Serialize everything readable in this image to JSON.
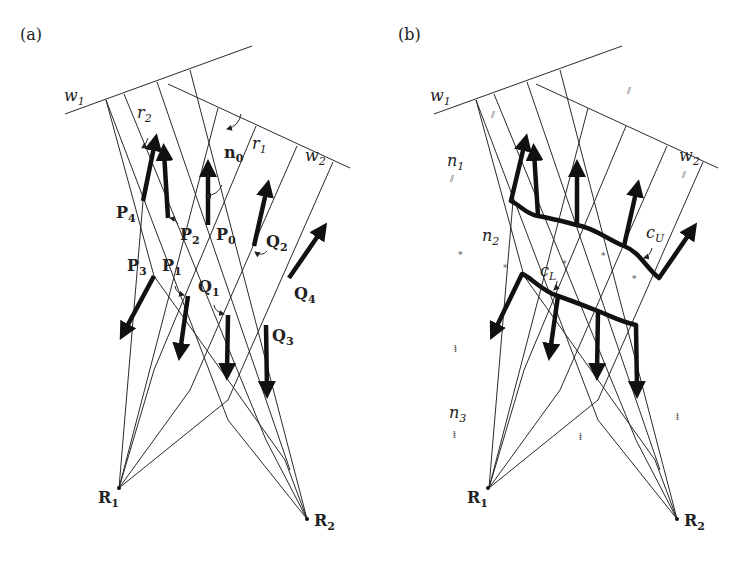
{
  "panels": [
    {
      "id": "a",
      "label": "(a)",
      "w1": "w",
      "w1_sub": "1",
      "w2": "w",
      "w2_sub": "2",
      "r1": "r",
      "r1_sub": "1",
      "r2": "r",
      "r2_sub": "2",
      "n0": "n",
      "n0_sub": "0",
      "points": [
        {
          "name": "P",
          "sub": "0"
        },
        {
          "name": "P",
          "sub": "1"
        },
        {
          "name": "P",
          "sub": "2"
        },
        {
          "name": "P",
          "sub": "3"
        },
        {
          "name": "P",
          "sub": "4"
        },
        {
          "name": "Q",
          "sub": "1"
        },
        {
          "name": "Q",
          "sub": "2"
        },
        {
          "name": "Q",
          "sub": "3"
        },
        {
          "name": "Q",
          "sub": "4"
        },
        {
          "name": "R",
          "sub": "1"
        },
        {
          "name": "R",
          "sub": "2"
        }
      ]
    },
    {
      "id": "b",
      "label": "(b)",
      "w1": "w",
      "w1_sub": "1",
      "w2": "w",
      "w2_sub": "2",
      "n1": "n",
      "n1_sub": "1",
      "n2": "n",
      "n2_sub": "2",
      "n3": "n",
      "n3_sub": "3",
      "cU": "c",
      "cU_sub": "U",
      "cL": "c",
      "cL_sub": "L",
      "R1": "R",
      "R1_sub": "1",
      "R2": "R",
      "R2_sub": "2",
      "hatch_n1": "⫽",
      "hatch_n2": "⁎",
      "hatch_n3": "ⱡ"
    }
  ]
}
